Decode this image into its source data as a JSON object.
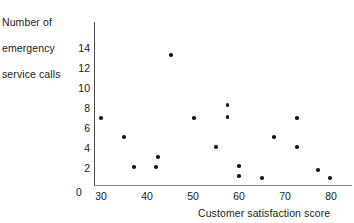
{
  "chart_data": {
    "type": "scatter",
    "title": "",
    "ylabel": "Number of\nemergency\nservice calls",
    "ylabel_lines": [
      "Number of",
      "emergency",
      "service calls"
    ],
    "xlabel": "Customer satisfaction score",
    "xlim": [
      27,
      84
    ],
    "ylim": [
      0,
      15
    ],
    "grid": false,
    "legend": null,
    "xticks": [
      30,
      40,
      50,
      60,
      70,
      80
    ],
    "xtick_labels": [
      "30",
      "40",
      "50",
      "60",
      "70",
      "80"
    ],
    "yticks": [
      0,
      2,
      4,
      6,
      8,
      10,
      12,
      14
    ],
    "ytick_labels": [
      "0",
      "2",
      "4",
      "6",
      "8",
      "10",
      "12",
      "14"
    ],
    "origin_label": "0",
    "marker_color": "#141414",
    "axis_color": "#4a4a4a",
    "points": [
      {
        "x": 30.0,
        "y": 7.0
      },
      {
        "x": 35.0,
        "y": 5.1
      },
      {
        "x": 37.2,
        "y": 2.1
      },
      {
        "x": 42.0,
        "y": 2.1
      },
      {
        "x": 42.4,
        "y": 3.1
      },
      {
        "x": 45.2,
        "y": 13.3
      },
      {
        "x": 50.2,
        "y": 7.0
      },
      {
        "x": 55.0,
        "y": 4.1
      },
      {
        "x": 57.5,
        "y": 8.3
      },
      {
        "x": 57.5,
        "y": 7.1
      },
      {
        "x": 60.0,
        "y": 2.2
      },
      {
        "x": 60.0,
        "y": 1.2
      },
      {
        "x": 65.0,
        "y": 1.0
      },
      {
        "x": 67.6,
        "y": 5.1
      },
      {
        "x": 72.6,
        "y": 7.0
      },
      {
        "x": 72.6,
        "y": 4.1
      },
      {
        "x": 77.2,
        "y": 1.8
      },
      {
        "x": 79.8,
        "y": 1.0
      }
    ]
  }
}
